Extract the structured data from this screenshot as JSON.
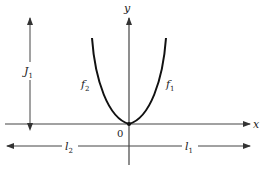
{
  "diagram": {
    "axes": {
      "x_label": "x",
      "y_label": "y",
      "origin_label": "0"
    },
    "curves": [
      {
        "name": "f",
        "subscript": "2",
        "side": "left"
      },
      {
        "name": "f",
        "subscript": "1",
        "side": "right"
      }
    ],
    "dimensions": {
      "height": {
        "name": "J",
        "subscript": "1"
      },
      "left_length": {
        "name": "l",
        "subscript": "2"
      },
      "right_length": {
        "name": "l",
        "subscript": "1"
      }
    },
    "colors": {
      "ink": "#222222",
      "axis": "#444444"
    }
  }
}
